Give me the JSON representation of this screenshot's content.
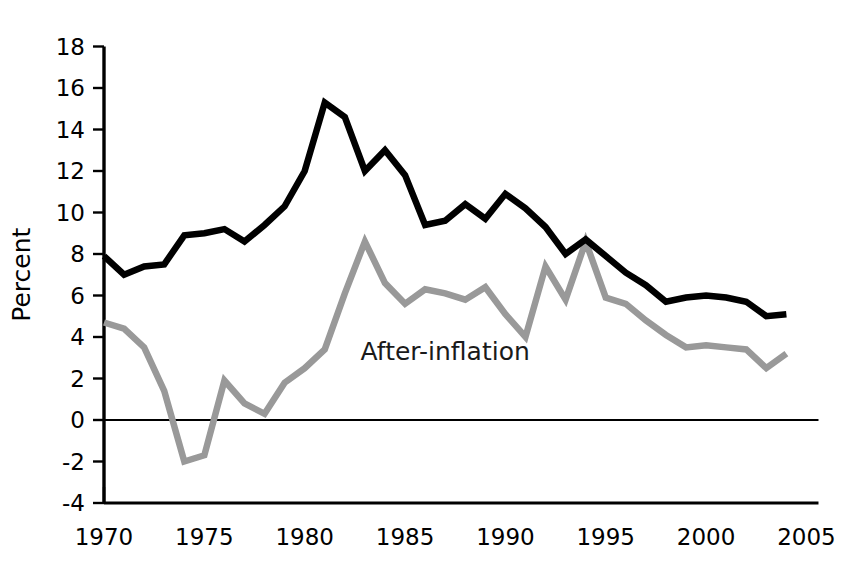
{
  "chart_data": {
    "type": "line",
    "title": "",
    "subtitle": "",
    "xlabel": "",
    "ylabel": "Percent",
    "xlim": [
      1969,
      2005.5
    ],
    "ylim": [
      -4,
      18
    ],
    "ytick_step": 2,
    "xtick_step": 5,
    "grid": false,
    "legend_position": "inline-annotation",
    "zero_line": 0,
    "x": [
      1970,
      1971,
      1972,
      1973,
      1974,
      1975,
      1976,
      1977,
      1978,
      1979,
      1980,
      1981,
      1982,
      1983,
      1984,
      1985,
      1986,
      1987,
      1988,
      1989,
      1990,
      1991,
      1992,
      1993,
      1994,
      1995,
      1996,
      1997,
      1998,
      1999,
      2000,
      2001,
      2002,
      2003,
      2004
    ],
    "xticks": [
      1970,
      1975,
      1980,
      1985,
      1990,
      1995,
      2000,
      2005
    ],
    "xtick_labels": [
      "1970",
      "1975",
      "1980",
      "1985",
      "1990",
      "1995",
      "2000",
      "2005"
    ],
    "yticks": [
      -4,
      -2,
      0,
      2,
      4,
      6,
      8,
      10,
      12,
      14,
      16,
      18
    ],
    "ytick_labels": [
      "-4",
      "-2",
      "0",
      "2",
      "4",
      "6",
      "8",
      "10",
      "12",
      "14",
      "16",
      "18"
    ],
    "series": [
      {
        "name": "Nominal",
        "color": "#000000",
        "width": 6.5,
        "annotation": "",
        "values": [
          7.9,
          7.0,
          7.4,
          7.5,
          8.9,
          9.0,
          9.2,
          8.6,
          9.4,
          10.3,
          12.0,
          15.3,
          14.6,
          12.0,
          13.0,
          11.8,
          9.4,
          9.6,
          10.4,
          9.7,
          10.9,
          10.2,
          9.3,
          8.0,
          8.7,
          7.9,
          7.1,
          6.5,
          5.7,
          5.9,
          6.0,
          5.9,
          5.7,
          5.0,
          5.1
        ]
      },
      {
        "name": "After-inflation",
        "color": "#999999",
        "width": 6.5,
        "annotation": "After-inflation",
        "annotation_x": 1987.0,
        "annotation_y": 2.9,
        "values": [
          4.7,
          4.4,
          3.5,
          1.4,
          -2.0,
          -1.7,
          1.9,
          0.8,
          0.3,
          1.8,
          2.5,
          3.4,
          6.1,
          8.6,
          6.6,
          5.6,
          6.3,
          6.1,
          5.8,
          6.4,
          5.1,
          4.0,
          7.4,
          5.8,
          8.6,
          5.9,
          5.6,
          4.8,
          4.1,
          3.5,
          3.6,
          3.5,
          3.4,
          2.5,
          3.2
        ]
      }
    ]
  }
}
